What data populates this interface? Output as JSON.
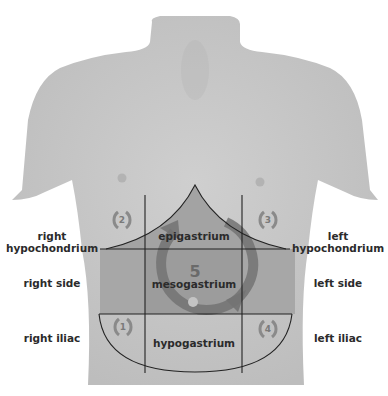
{
  "diagram": {
    "title": "",
    "colors": {
      "background": "#ffffff",
      "skin": "#c9c9c9",
      "skin_shade": "#b9b9b9",
      "center_region": "#9f9f9f",
      "mid_band": "#a6a6a6",
      "arrow": "#6f6f6f",
      "lines": "#222222",
      "text": "#2b2b2b"
    },
    "side_labels": {
      "right_hypochondrium": [
        "right",
        "hypochondrium"
      ],
      "right_side": "right side",
      "right_iliac": "right iliac",
      "left_hypochondrium": [
        "left",
        "hypochondrium"
      ],
      "left_side": "left side",
      "left_iliac": "left iliac"
    },
    "regions": {
      "epigastrium": "epigastrium",
      "mesogastrium": "mesogastrium",
      "hypogastrium": "hypogastrium"
    },
    "sequence_numbers": {
      "n1": "1",
      "n2": "2",
      "n3": "3",
      "n4": "4",
      "n5": "5"
    }
  }
}
